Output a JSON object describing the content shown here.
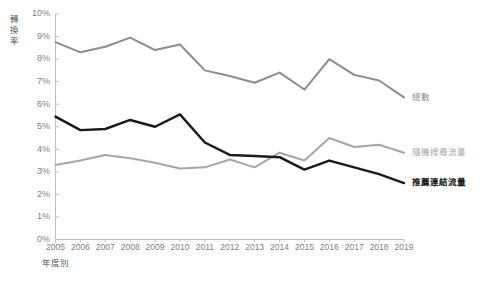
{
  "chart_data": {
    "type": "line",
    "title": "",
    "xlabel": "年度別",
    "ylabel": "轉換率",
    "categories": [
      "2005",
      "2006",
      "2007",
      "2008",
      "2009",
      "2010",
      "2011",
      "2012",
      "2013",
      "2014",
      "2015",
      "2016",
      "2017",
      "2018",
      "2019"
    ],
    "ylim": [
      0,
      10
    ],
    "ytick_labels": [
      "0%",
      "1%",
      "2%",
      "3%",
      "4%",
      "5%",
      "6%",
      "7%",
      "8%",
      "9%",
      "10%"
    ],
    "ytick_values": [
      0,
      1,
      2,
      3,
      4,
      5,
      6,
      7,
      8,
      9,
      10
    ],
    "grid": false,
    "legend_position": "inline-right",
    "series": [
      {
        "name": "總數",
        "color": "#8c8c8c",
        "width": 2,
        "bold_label": false,
        "values": [
          8.75,
          8.3,
          8.55,
          8.95,
          8.4,
          8.65,
          7.5,
          7.25,
          6.95,
          7.4,
          6.65,
          8.0,
          7.3,
          7.05,
          6.3
        ]
      },
      {
        "name": "隨機搜尋流量",
        "color": "#a6a6a6",
        "width": 2,
        "bold_label": false,
        "values": [
          3.3,
          3.5,
          3.75,
          3.6,
          3.4,
          3.15,
          3.2,
          3.55,
          3.2,
          3.85,
          3.5,
          4.5,
          4.1,
          4.2,
          3.85
        ]
      },
      {
        "name": "推薦連結流量",
        "color": "#1a1a1a",
        "width": 2.4,
        "bold_label": true,
        "values": [
          5.45,
          4.85,
          4.9,
          5.3,
          5.0,
          5.55,
          4.3,
          3.75,
          3.7,
          3.65,
          3.1,
          3.5,
          3.2,
          2.9,
          2.5
        ]
      }
    ]
  },
  "axis_title_colors": {
    "x": "#595959",
    "y": "#595959"
  },
  "tick_color": "#808080"
}
